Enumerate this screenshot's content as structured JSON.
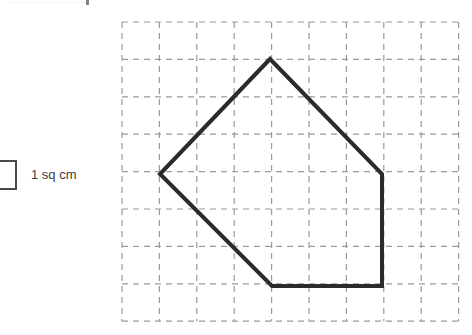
{
  "legend": {
    "label": "1 sq cm",
    "swatch_name": "unit-square",
    "border_color": "#4a4a4a",
    "text_color": "#3c3c3c"
  },
  "grid": {
    "columns": 9,
    "rows": 8,
    "cell_size_px": 37.4,
    "origin_x": 122,
    "origin_y": 22,
    "line_color": "#9a9a9a",
    "dash": "6 5",
    "style": "dashed"
  },
  "chart_data": {
    "type": "scatter",
    "title": "",
    "xlabel": "",
    "ylabel": "",
    "shape": "pentagon",
    "unit": "1 sq cm",
    "stroke_color": "#2b2b2b",
    "stroke_width": 4,
    "fill": "none",
    "grid": true,
    "xlim": [
      0,
      9
    ],
    "ylim": [
      0,
      8
    ],
    "vertices_grid": [
      {
        "name": "top",
        "x": 4,
        "y": 1
      },
      {
        "name": "right",
        "x": 7,
        "y": 4
      },
      {
        "name": "bottom-right",
        "x": 7,
        "y": 7
      },
      {
        "name": "bottom-left",
        "x": 4,
        "y": 7
      },
      {
        "name": "left",
        "x": 1,
        "y": 4
      }
    ],
    "vertices_px": [
      {
        "x": 270,
        "y": 59
      },
      {
        "x": 382,
        "y": 174
      },
      {
        "x": 382,
        "y": 286
      },
      {
        "x": 272,
        "y": 286
      },
      {
        "x": 160,
        "y": 174
      }
    ],
    "polygon_points": "270,59 382,174 382,286 272,286 160,174"
  }
}
